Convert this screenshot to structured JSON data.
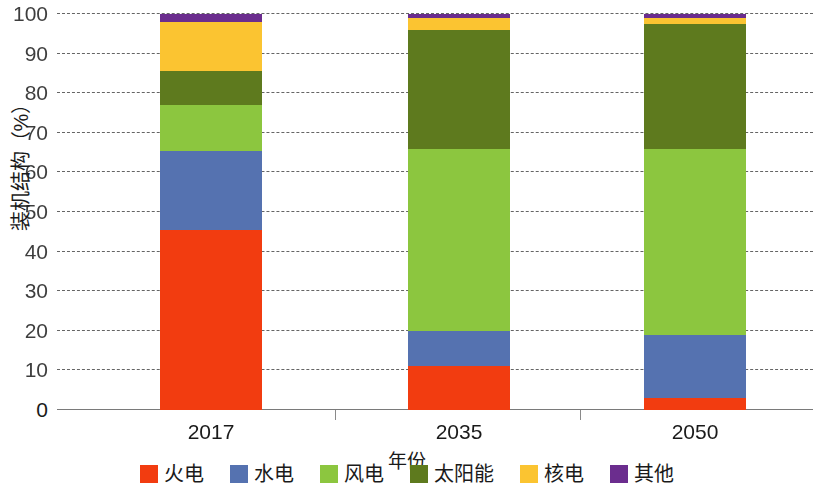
{
  "chart_data": {
    "type": "bar",
    "subtype": "stacked-bar-100",
    "title": "",
    "xlabel": "年份",
    "ylabel": "装机结构（%）",
    "categories": [
      "2017",
      "2035",
      "2050"
    ],
    "ylim": [
      0,
      100
    ],
    "yticks": [
      0,
      10,
      20,
      30,
      40,
      50,
      60,
      70,
      80,
      90,
      100
    ],
    "ytick_labels": [
      "0",
      "10",
      "20",
      "30",
      "40",
      "50",
      "60",
      "70",
      "80",
      "90",
      "100"
    ],
    "grid": true,
    "legend_position": "bottom",
    "series": [
      {
        "name": "火电",
        "color": "#F23C10",
        "values": [
          45.5,
          11.0,
          3.0
        ]
      },
      {
        "name": "水电",
        "color": "#5572B0",
        "values": [
          20.0,
          9.0,
          16.0
        ]
      },
      {
        "name": "风电",
        "color": "#8CC63F",
        "values": [
          11.5,
          46.0,
          47.0
        ]
      },
      {
        "name": "太阳能",
        "color": "#5E7A1E",
        "values": [
          8.5,
          30.0,
          31.5
        ]
      },
      {
        "name": "核电",
        "color": "#FBC431",
        "values": [
          12.5,
          3.0,
          1.5
        ]
      },
      {
        "name": "其他",
        "color": "#6B2D8E",
        "values": [
          2.0,
          1.0,
          1.0
        ]
      }
    ]
  },
  "axes": {
    "y_title": "装机结构（%）",
    "x_title": "年份"
  },
  "legend": {
    "entries": [
      {
        "label": "火电",
        "color": "#F23C10"
      },
      {
        "label": "水电",
        "color": "#5572B0"
      },
      {
        "label": "风电",
        "color": "#8CC63F"
      },
      {
        "label": "太阳能",
        "color": "#5E7A1E"
      },
      {
        "label": "核电",
        "color": "#FBC431"
      },
      {
        "label": "其他",
        "color": "#6B2D8E"
      }
    ]
  }
}
